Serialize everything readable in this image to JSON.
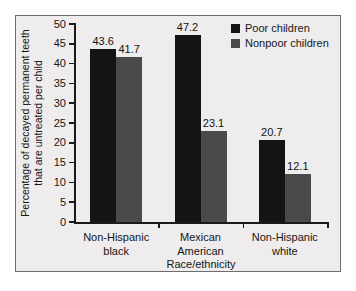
{
  "chart_data": {
    "type": "bar",
    "title": "",
    "subtitle": "",
    "xlabel": "Race/ethnicity",
    "ylabel": "Percentage of decayed permanent teeth that are untreated per child",
    "ylabel_line1": "Percentage of decayed permanent teeth",
    "ylabel_line2": "that are untreated per child",
    "categories": [
      "Non-Hispanic black",
      "Mexican American",
      "Non-Hispanic white"
    ],
    "category_lines": [
      [
        "Non-Hispanic",
        "black"
      ],
      [
        "Mexican",
        "American"
      ],
      [
        "Non-Hispanic",
        "white"
      ]
    ],
    "series": [
      {
        "name": "Poor children",
        "color": "#141414",
        "values": [
          43.6,
          47.2,
          20.7
        ],
        "labels": [
          "43.6",
          "47.2",
          "20.7"
        ]
      },
      {
        "name": "Nonpoor children",
        "color": "#4a4a4a",
        "values": [
          41.7,
          23.1,
          12.1
        ],
        "labels": [
          "41.7",
          "23.1",
          "12.1"
        ]
      }
    ],
    "ylim": [
      0,
      50
    ],
    "ytick_values": [
      0,
      5,
      10,
      15,
      20,
      25,
      30,
      35,
      40,
      45,
      50
    ],
    "ytick_labels": [
      "0",
      "5",
      "10",
      "15",
      "20",
      "25",
      "30",
      "35",
      "40",
      "45",
      "50"
    ],
    "grid": false,
    "legend_position": "top-right",
    "legend_entries": [
      "Poor children",
      "Nonpoor children"
    ]
  },
  "figure": {
    "panel_background": "#eeecec",
    "panel_border_color": "#6d6d6d",
    "outer_background": "#ffffff",
    "axis_color": "#1a1a1a",
    "text_color": "#161616"
  }
}
